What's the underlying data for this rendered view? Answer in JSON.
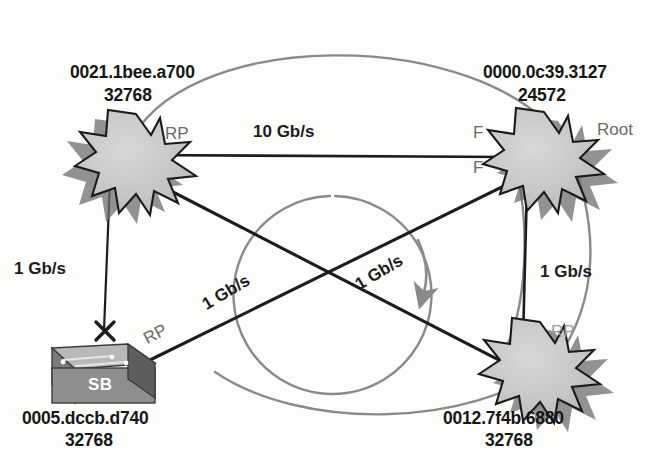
{
  "diagram": {
    "type": "network-topology",
    "colors": {
      "node_fill": "#c9c9c9",
      "node_outline": "#1a1a1a",
      "node_shadow": "#6e6e6e",
      "link": "#1c1c1c",
      "loop_arc": "#8a8a8a",
      "switch_body": "#8e8e8e",
      "switch_top": "#b9b9b9",
      "switch_side": "#5d5d5d",
      "text": "#161616",
      "port_text": "#6a6a6a"
    }
  },
  "nodes": [
    {
      "id": "node-top-left",
      "kind": "starburst",
      "mac": "0021.1bee.a700",
      "priority": "32768",
      "x": 120,
      "y": 150
    },
    {
      "id": "node-top-right",
      "kind": "starburst",
      "mac": "0000.0c39.3127",
      "priority": "24572",
      "role_label": "Root",
      "x": 535,
      "y": 150
    },
    {
      "id": "node-bottom-right",
      "kind": "starburst",
      "mac": "0012.7f4b.6880",
      "priority": "32768",
      "x": 535,
      "y": 365
    },
    {
      "id": "node-bottom-left",
      "kind": "switch",
      "badge": "SB",
      "mac": "0005.dccb.d740",
      "priority": "32768",
      "x": 100,
      "y": 360
    }
  ],
  "links": [
    {
      "id": "link-top",
      "speed": "10 Gb/s",
      "from": "node-top-left",
      "to": "node-top-right"
    },
    {
      "id": "link-left-vertical",
      "speed": "1 Gb/s",
      "from": "node-top-left",
      "to": "node-bottom-left"
    },
    {
      "id": "link-right-vertical",
      "speed": "1 Gb/s",
      "from": "node-top-right",
      "to": "node-bottom-right"
    },
    {
      "id": "link-diagonal-a",
      "speed": "1 Gb/s",
      "from": "node-bottom-left",
      "to": "node-top-right"
    },
    {
      "id": "link-diagonal-b",
      "speed": "1 Gb/s",
      "from": "node-top-left",
      "to": "node-bottom-right"
    }
  ],
  "port_labels": [
    {
      "id": "port-tl-rp",
      "text": "RP"
    },
    {
      "id": "port-tr-f-upper",
      "text": "F"
    },
    {
      "id": "port-tr-f-lower",
      "text": "F"
    },
    {
      "id": "port-sb-rp",
      "text": "RP"
    },
    {
      "id": "port-br-rp",
      "text": "RP"
    }
  ],
  "markers": {
    "blocked_port_symbol": "X",
    "loop_arrow_direction": "clockwise"
  }
}
